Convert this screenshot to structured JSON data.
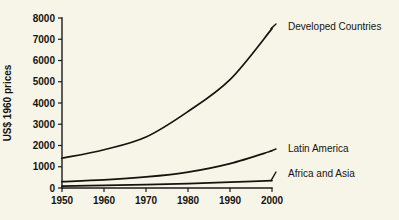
{
  "chart_data": {
    "type": "line",
    "title": "",
    "subtitle": "",
    "xlabel": "",
    "ylabel": "US$ 1960 prices",
    "xlim": [
      1950,
      2000
    ],
    "ylim": [
      0,
      8000
    ],
    "grid": false,
    "legend_position": "inline-right-labels",
    "x": [
      1950,
      1960,
      1970,
      1980,
      1990,
      2000
    ],
    "xticks": [
      "1950",
      "1960",
      "1970",
      "1980",
      "1990",
      "2000"
    ],
    "yticks": [
      "0",
      "1000",
      "2000",
      "3000",
      "4000",
      "5000",
      "6000",
      "7000",
      "8000"
    ],
    "ytick_values": [
      0,
      1000,
      2000,
      3000,
      4000,
      5000,
      6000,
      7000,
      8000
    ],
    "series": [
      {
        "name": "Developed Countries",
        "values": [
          1400,
          1800,
          2400,
          3600,
          5100,
          7500
        ],
        "color": "#16130f"
      },
      {
        "name": "Latin America",
        "values": [
          300,
          380,
          520,
          750,
          1150,
          1750
        ],
        "color": "#16130f"
      },
      {
        "name": "Africa and Asia",
        "values": [
          90,
          120,
          160,
          210,
          275,
          350
        ],
        "color": "#16130f"
      }
    ],
    "annotations": [
      {
        "label": "Developed Countries",
        "series": "Developed Countries"
      },
      {
        "label": "Latin America",
        "series": "Latin America"
      },
      {
        "label": "Africa and Asia",
        "series": "Africa and Asia"
      }
    ],
    "colors": {
      "background": "#f7f5e8",
      "axis": "#1b1b1b",
      "line": "#16130f",
      "text": "#16130f"
    }
  }
}
